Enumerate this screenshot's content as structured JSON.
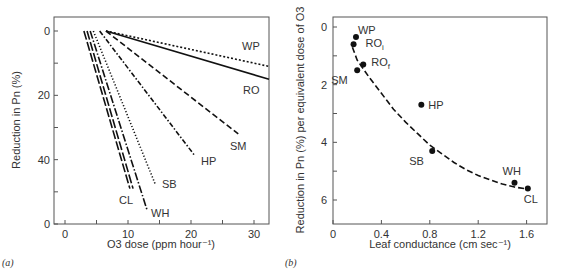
{
  "chart_data": [
    {
      "type": "line",
      "panel_label": "(a)",
      "title": "",
      "xlabel": "O3 dose (ppm hour⁻¹)",
      "ylabel": "Reduction in Pn (%)",
      "xlim": [
        -3,
        33
      ],
      "ylim": [
        0,
        60
      ],
      "y_inverted": true,
      "x_ticks": [
        0,
        10,
        20,
        30
      ],
      "y_ticks": [
        0,
        20,
        40,
        60
      ],
      "y_tick_labels": [
        "0",
        "20",
        "40",
        "0"
      ],
      "grid": false,
      "series": [
        {
          "name": "WP",
          "style": "dotted-dense",
          "x": [
            6.5,
            33
          ],
          "y": [
            0,
            11
          ]
        },
        {
          "name": "RO",
          "style": "solid",
          "x": [
            6.5,
            33
          ],
          "y": [
            0,
            15
          ]
        },
        {
          "name": "SM",
          "style": "dashed",
          "x": [
            6.5,
            27.5
          ],
          "y": [
            0,
            32
          ]
        },
        {
          "name": "HP",
          "style": "dash-dot",
          "x": [
            5.5,
            20.5
          ],
          "y": [
            0,
            38.5
          ]
        },
        {
          "name": "SB",
          "style": "dotted",
          "x": [
            4.5,
            14.3
          ],
          "y": [
            0,
            47.5
          ]
        },
        {
          "name": "WH",
          "style": "dash-dot-long",
          "x": [
            4.0,
            13.0
          ],
          "y": [
            0,
            55.5
          ]
        },
        {
          "name": "CL",
          "style": "long-dash",
          "x": [
            3.5,
            10.8
          ],
          "y": [
            0,
            49
          ]
        }
      ]
    },
    {
      "type": "scatter",
      "panel_label": "(b)",
      "title": "",
      "xlabel": "Leaf conductance (cm sec⁻¹)",
      "ylabel": "Reduction in Pn (%) per equivalent dose of O3",
      "xlim": [
        0,
        1.77
      ],
      "ylim": [
        -0.35,
        6.8
      ],
      "y_inverted": true,
      "x_ticks": [
        0,
        0.4,
        0.8,
        1.2,
        1.6
      ],
      "x_tick_labels": [
        "0",
        "0.4",
        "0.8",
        "1.2",
        "1.6"
      ],
      "y_ticks": [
        0,
        2,
        4,
        6
      ],
      "y_minor_ticks": [
        1,
        3,
        5
      ],
      "grid": false,
      "points": [
        {
          "label": "WP",
          "x": 0.19,
          "y": 0.35
        },
        {
          "label": "ROi",
          "x": 0.17,
          "y": 0.6
        },
        {
          "label": "ROf",
          "x": 0.25,
          "y": 1.3
        },
        {
          "label": "SM",
          "x": 0.2,
          "y": 1.5
        },
        {
          "label": "HP",
          "x": 0.73,
          "y": 2.7
        },
        {
          "label": "SB",
          "x": 0.82,
          "y": 4.3
        },
        {
          "label": "WH",
          "x": 1.5,
          "y": 5.4
        },
        {
          "label": "CL",
          "x": 1.61,
          "y": 5.6
        }
      ],
      "fit_curve": {
        "style": "dashed",
        "x": [
          0.16,
          0.2,
          0.3,
          0.4,
          0.5,
          0.6,
          0.7,
          0.8,
          0.9,
          1.0,
          1.1,
          1.2,
          1.3,
          1.4,
          1.5,
          1.6
        ],
        "y": [
          0.7,
          1.15,
          1.75,
          2.3,
          2.85,
          3.3,
          3.7,
          4.1,
          4.4,
          4.7,
          4.95,
          5.15,
          5.3,
          5.45,
          5.55,
          5.62
        ]
      }
    }
  ]
}
